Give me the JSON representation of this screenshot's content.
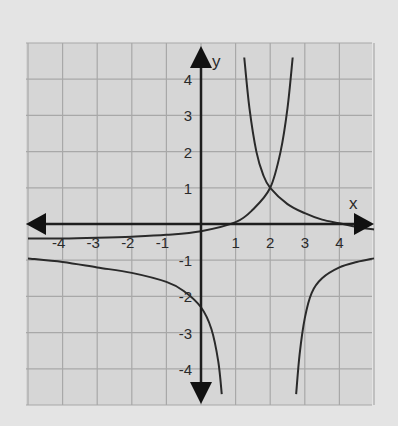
{
  "chart_data": {
    "type": "line",
    "title": "",
    "xlabel": "x",
    "ylabel": "y",
    "xlim": [
      -5,
      5
    ],
    "ylim": [
      -5,
      5
    ],
    "grid": true,
    "x_ticks": [
      "-4",
      "-3",
      "-2",
      "-1",
      "1",
      "2",
      "3",
      "4"
    ],
    "y_ticks": [
      "4",
      "3",
      "2",
      "1",
      "-1",
      "-2",
      "-3",
      "-4"
    ],
    "series": [
      {
        "name": "increasing exponential (asymptote y≈-0.4)",
        "x": [
          -5,
          -4,
          -3,
          -2,
          -1,
          0,
          1,
          1.5,
          2,
          2.3,
          2.5,
          2.65
        ],
        "y": [
          -0.4,
          -0.4,
          -0.38,
          -0.35,
          -0.3,
          -0.2,
          0.05,
          0.4,
          1,
          2,
          3.2,
          4.6
        ]
      },
      {
        "name": "decreasing exponential",
        "x": [
          1.25,
          1.4,
          1.6,
          1.8,
          2,
          2.5,
          3,
          3.5,
          4,
          4.5,
          5
        ],
        "y": [
          4.6,
          3.2,
          2,
          1.35,
          1,
          0.55,
          0.3,
          0.12,
          0.02,
          -0.08,
          -0.15
        ]
      },
      {
        "name": "hyperbola left branch",
        "x": [
          -5,
          -4,
          -3,
          -2,
          -1,
          -0.5,
          0,
          0.3,
          0.5,
          0.6
        ],
        "y": [
          -0.95,
          -1.05,
          -1.2,
          -1.35,
          -1.6,
          -1.85,
          -2.3,
          -2.9,
          -3.8,
          -4.7
        ]
      },
      {
        "name": "hyperbola right branch",
        "x": [
          2.75,
          2.85,
          3,
          3.2,
          3.5,
          4,
          4.5,
          5
        ],
        "y": [
          -4.7,
          -3.6,
          -2.6,
          -1.9,
          -1.5,
          -1.2,
          -1.05,
          -0.95
        ]
      }
    ],
    "annotations": [
      {
        "text": "intersection",
        "x": 2,
        "y": 1
      }
    ]
  },
  "labels": {
    "x_axis": "x",
    "y_axis": "y"
  },
  "ticks": {
    "x": [
      {
        "v": -4,
        "t": "-4"
      },
      {
        "v": -3,
        "t": "-3"
      },
      {
        "v": -2,
        "t": "-2"
      },
      {
        "v": -1,
        "t": "-1"
      },
      {
        "v": 1,
        "t": "1"
      },
      {
        "v": 2,
        "t": "2"
      },
      {
        "v": 3,
        "t": "3"
      },
      {
        "v": 4,
        "t": "4"
      }
    ],
    "y": [
      {
        "v": 4,
        "t": "4"
      },
      {
        "v": 3,
        "t": "3"
      },
      {
        "v": 2,
        "t": "2"
      },
      {
        "v": 1,
        "t": "1"
      },
      {
        "v": -1,
        "t": "-1"
      },
      {
        "v": -2,
        "t": "-2"
      },
      {
        "v": -3,
        "t": "-3"
      },
      {
        "v": -4,
        "t": "-4"
      }
    ]
  },
  "colors": {
    "background": "#e4e4e4",
    "grid_bg": "#d6d6d6",
    "grid_line": "#a8a8a8",
    "curve": "#2a2a2a",
    "axis": "#1e1e1e"
  }
}
